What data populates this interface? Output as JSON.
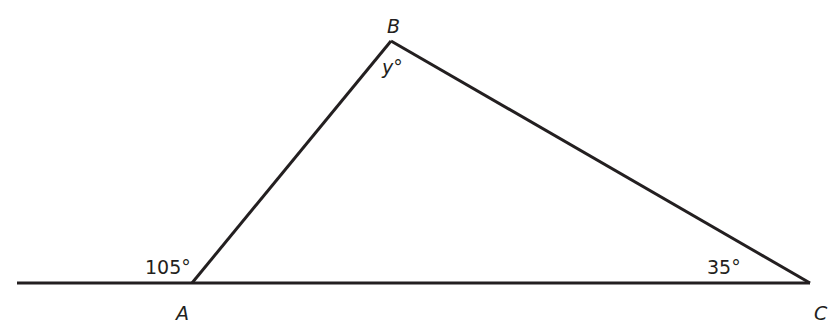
{
  "diagram": {
    "type": "triangle-with-extended-base",
    "stroke_color": "#231f20",
    "vertices": {
      "A": {
        "label": "A",
        "x": 192,
        "y": 283
      },
      "B": {
        "label": "B",
        "x": 391,
        "y": 41
      },
      "C": {
        "label": "C",
        "x": 810,
        "y": 283
      }
    },
    "base_line": {
      "x1": 17,
      "y1": 283,
      "x2": 810,
      "y2": 283
    },
    "angles": {
      "exterior_A": "105°",
      "angle_B": "y°",
      "angle_C": "35°"
    }
  }
}
